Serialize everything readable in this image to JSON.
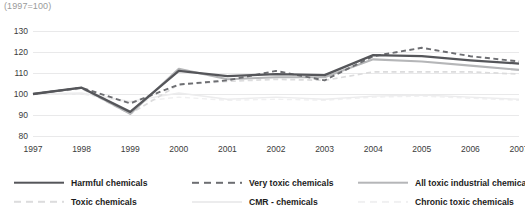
{
  "chart_data": {
    "type": "line",
    "title": "(1997=100)",
    "xlabel": "",
    "ylabel": "",
    "ylim": [
      80,
      130
    ],
    "ytick_values": [
      80,
      90,
      100,
      110,
      120,
      130
    ],
    "ytick_labels": [
      "80",
      "90",
      "100",
      "110",
      "120",
      "130"
    ],
    "grid": true,
    "grid_axis": "y",
    "legend_position": "bottom",
    "legend_columns": 3,
    "categories": [
      "1997",
      "1998",
      "1999",
      "2000",
      "2001",
      "2002",
      "2003",
      "2004",
      "2005",
      "2006",
      "2007"
    ],
    "x": [
      1997,
      1998,
      1999,
      2000,
      2001,
      2002,
      2003,
      2004,
      2005,
      2006,
      2007
    ],
    "series": [
      {
        "name": "Harmful chemicals",
        "style": "solid",
        "color": "#55565a",
        "width": 2.3,
        "values": [
          100,
          103,
          91.5,
          111,
          108.5,
          109.5,
          109,
          118.5,
          118,
          116,
          114.5
        ]
      },
      {
        "name": "Very toxic chemicals",
        "style": "dashed",
        "color": "#6d6e72",
        "width": 1.9,
        "values": [
          100,
          103,
          95.5,
          104.5,
          106.5,
          111,
          106.5,
          118,
          122,
          118,
          115.5
        ]
      },
      {
        "name": "All toxic industrial chemicals",
        "style": "solid",
        "color": "#b5b6b8",
        "width": 2.1,
        "values": [
          100,
          103,
          90.5,
          112,
          107,
          108,
          108,
          116.5,
          115.5,
          113.5,
          111.5
        ]
      },
      {
        "name": "Toxic chemicals",
        "style": "dashed",
        "color": "#dcdcdd",
        "width": 1.7,
        "values": [
          100,
          102.5,
          90.5,
          104.5,
          106,
          107,
          106.5,
          110.5,
          110.5,
          110.5,
          109.5
        ]
      },
      {
        "name": "CMR - chemicals",
        "style": "solid",
        "color": "#ececed",
        "width": 1.4,
        "values": [
          100,
          100.5,
          96.5,
          100.5,
          97.5,
          98.5,
          97.5,
          99,
          99.5,
          98.5,
          97.5
        ]
      },
      {
        "name": "Chronic toxic chemicals",
        "style": "dashed",
        "color": "#f0f0f1",
        "width": 1.4,
        "values": [
          100,
          100,
          96,
          98.5,
          97,
          97.5,
          97,
          98.5,
          99,
          98,
          97
        ]
      }
    ]
  },
  "legend": {
    "items": [
      {
        "label": "Harmful chemicals",
        "style": "solid",
        "color": "#55565a",
        "width": 2.6
      },
      {
        "label": "Very toxic chemicals",
        "style": "dashed",
        "color": "#6d6e72",
        "width": 2.4
      },
      {
        "label": "All toxic industrial chemicals",
        "style": "solid",
        "color": "#b5b6b8",
        "width": 2.6
      },
      {
        "label": "Toxic chemicals",
        "style": "dashed",
        "color": "#dcdcdd",
        "width": 2.4
      },
      {
        "label": "CMR - chemicals",
        "style": "solid",
        "color": "#ececed",
        "width": 2.0
      },
      {
        "label": "Chronic toxic chemicals",
        "style": "dashed",
        "color": "#f0f0f1",
        "width": 2.2
      }
    ]
  },
  "colors": {
    "background": "#ffffff",
    "gridline": "#e9e9ea",
    "axis_text": "#3b3b3b",
    "title_text": "#9a9a9a"
  }
}
